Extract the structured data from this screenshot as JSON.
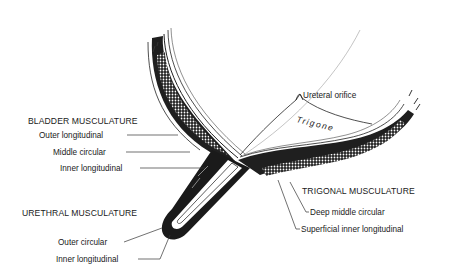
{
  "diagram": {
    "type": "anatomical-cross-section",
    "colors": {
      "ink": "#1a1a1a",
      "background": "#ffffff"
    },
    "bladder": {
      "heading": "BLADDER MUSCULATURE",
      "layers": [
        "Outer longitudinal",
        "Middle circular",
        "Inner longitudinal"
      ]
    },
    "urethra": {
      "heading": "URETHRAL MUSCULATURE",
      "layers": [
        "Outer circular",
        "Inner longitudinal"
      ]
    },
    "trigone": {
      "region_label": "Trigone",
      "orifice_label": "Ureteral orifice",
      "heading": "TRIGONAL MUSCULATURE",
      "layers": [
        "Deep middle circular",
        "Superficial inner longitudinal"
      ]
    }
  }
}
